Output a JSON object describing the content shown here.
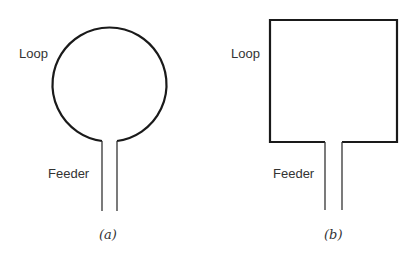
{
  "figure": {
    "panel_a": {
      "shape": "circle",
      "loop_label": "Loop",
      "feeder_label": "Feeder",
      "caption": "(a)"
    },
    "panel_b": {
      "shape": "square",
      "loop_label": "Loop",
      "feeder_label": "Feeder",
      "caption": "(b)"
    },
    "colors": {
      "stroke": "#1a1a1a",
      "text": "#333333",
      "background": "#ffffff"
    }
  }
}
